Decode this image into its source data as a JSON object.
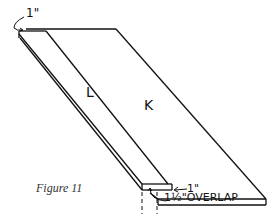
{
  "figure": {
    "caption": "Figure 11",
    "labels": {
      "board_l": "L",
      "board_k": "K",
      "top_dimension": "1\"",
      "end_dimension": "1\"",
      "overlap_dimension": "1½\"OVERLAP"
    },
    "colors": {
      "line": "#111111",
      "background": "#ffffff"
    }
  }
}
